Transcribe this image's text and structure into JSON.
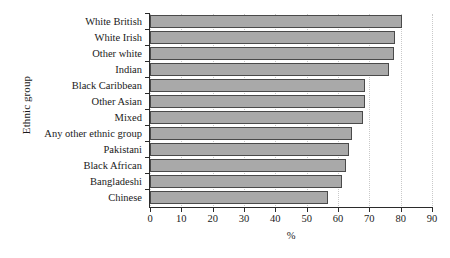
{
  "chart_data": {
    "type": "bar",
    "orientation": "horizontal",
    "title": "",
    "xlabel": "%",
    "ylabel": "Ethnic group",
    "xlim": [
      0,
      90
    ],
    "xticks": [
      0,
      10,
      20,
      30,
      40,
      50,
      60,
      70,
      80,
      90
    ],
    "grid": "vertical dotted gridlines",
    "legend": "none",
    "bar_color": "#a9a9a9",
    "bar_border_color": "#4a4a4a",
    "axis_color": "#2b2b2b",
    "gridline_color": "#c9c9c9",
    "categories": [
      "White British",
      "White Irish",
      "Other white",
      "Indian",
      "Black Caribbean",
      "Other Asian",
      "Mixed",
      "Any other ethnic group",
      "Pakistani",
      "Black African",
      "Bangladeshi",
      "Chinese"
    ],
    "values": [
      80.4,
      78.3,
      78.0,
      76.2,
      68.6,
      68.5,
      68.0,
      64.4,
      63.5,
      62.4,
      61.3,
      56.8
    ]
  }
}
